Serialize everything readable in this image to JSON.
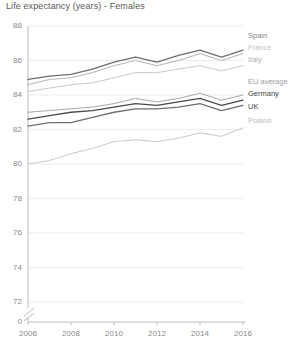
{
  "chart_data": {
    "type": "line",
    "title": "Life expectancy (years) - Females",
    "xlabel": "",
    "ylabel": "",
    "grid": true,
    "legend_position": "right",
    "axis_break": true,
    "x": [
      2006,
      2007,
      2008,
      2009,
      2010,
      2011,
      2012,
      2013,
      2014,
      2015,
      2016
    ],
    "xticks": [
      "2006",
      "2008",
      "2010",
      "2012",
      "2014",
      "2016"
    ],
    "yticks": [
      "88",
      "86",
      "84",
      "82",
      "80",
      "78",
      "76",
      "74",
      "72",
      "0"
    ],
    "ylim": [
      71.2,
      88.4
    ],
    "xlim": [
      2006,
      2016
    ],
    "series": [
      {
        "name": "Spain",
        "color": "#6e6e6e",
        "values": [
          84.9,
          85.1,
          85.2,
          85.5,
          85.9,
          86.2,
          85.9,
          86.3,
          86.6,
          86.2,
          86.6
        ]
      },
      {
        "name": "France",
        "color": "#b4b4b4",
        "values": [
          84.6,
          84.9,
          85.0,
          85.3,
          85.7,
          86.0,
          85.7,
          86.0,
          86.4,
          86.0,
          86.4
        ]
      },
      {
        "name": "Italy",
        "color": "#c9c9c9",
        "values": [
          84.2,
          84.4,
          84.6,
          84.7,
          85.0,
          85.3,
          85.3,
          85.5,
          85.7,
          85.4,
          85.7
        ]
      },
      {
        "name": "EU average",
        "color": "#a8a8a8",
        "values": [
          83.0,
          83.1,
          83.2,
          83.3,
          83.5,
          83.8,
          83.6,
          83.8,
          84.1,
          83.7,
          84.0
        ]
      },
      {
        "name": "Germany",
        "color": "#4a4a4a",
        "values": [
          82.6,
          82.8,
          83.0,
          83.1,
          83.3,
          83.5,
          83.4,
          83.6,
          83.8,
          83.4,
          83.7
        ]
      },
      {
        "name": "UK",
        "color": "#6e6e6e",
        "values": [
          82.2,
          82.4,
          82.4,
          82.7,
          83.0,
          83.2,
          83.2,
          83.3,
          83.5,
          83.1,
          83.4
        ]
      },
      {
        "name": "Poland",
        "color": "#c9c9c9",
        "values": [
          80.0,
          80.2,
          80.6,
          80.9,
          81.3,
          81.4,
          81.3,
          81.5,
          81.8,
          81.6,
          82.1
        ]
      }
    ]
  },
  "legend": {
    "items": [
      {
        "label": "Spain",
        "color": "#8a8a8a",
        "weight": "normal"
      },
      {
        "label": "France",
        "color": "#c2c2c2",
        "weight": "normal"
      },
      {
        "label": "Italy",
        "color": "#b0b0b0",
        "weight": "normal"
      },
      {
        "label": "EU average",
        "color": "#a0a0a0",
        "weight": "normal"
      },
      {
        "label": "Germany",
        "color": "#3f3f3f",
        "weight": "normal"
      },
      {
        "label": "UK",
        "color": "#3f3f3f",
        "weight": "normal"
      },
      {
        "label": "Poland",
        "color": "#bdbdbd",
        "weight": "normal"
      }
    ]
  },
  "colors": {
    "axis": "#bdbdbd",
    "grid": "#ebebeb",
    "tick_text": "#8a8a8a",
    "title_text": "#5c5c5c",
    "background": "#ffffff"
  }
}
